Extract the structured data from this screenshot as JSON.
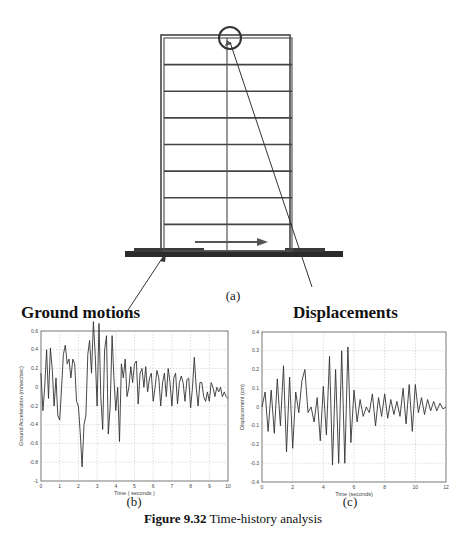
{
  "figure": {
    "caption_prefix": "Figure 9.32",
    "caption_text": " Time-history analysis",
    "panel_a_label": "(a)",
    "panel_b_label": "(b)",
    "panel_c_label": "(c)",
    "left_annotation": "Ground motions",
    "right_annotation": "Displacements"
  },
  "building": {
    "stories": 8,
    "description": "Multi-story frame with central column, top-right marked with circle, ground motion arrow at base"
  },
  "chart_data": [
    {
      "type": "line",
      "panel": "(b)",
      "title": "",
      "xlabel": "Time ( seconds )",
      "ylabel": "Ground Acceleration (m/sec/sec)",
      "xlim": [
        0,
        10
      ],
      "ylim": [
        -1,
        0.6
      ],
      "xticks": [
        "0",
        "1",
        "2",
        "3",
        "4",
        "5",
        "6",
        "7",
        "8",
        "9",
        "10"
      ],
      "yticks": [
        "0.6",
        "0.4",
        "0.2",
        "0",
        "-0.2",
        "-0.4",
        "-0.6",
        "-0.8",
        "-1"
      ],
      "grid": true,
      "x": [
        0,
        0.1,
        0.2,
        0.3,
        0.4,
        0.5,
        0.6,
        0.7,
        0.8,
        0.9,
        1.0,
        1.1,
        1.2,
        1.3,
        1.4,
        1.5,
        1.6,
        1.7,
        1.8,
        1.9,
        2.0,
        2.1,
        2.2,
        2.3,
        2.4,
        2.5,
        2.6,
        2.7,
        2.8,
        2.9,
        3.0,
        3.1,
        3.2,
        3.3,
        3.4,
        3.5,
        3.6,
        3.7,
        3.8,
        3.9,
        4.0,
        4.1,
        4.2,
        4.3,
        4.4,
        4.5,
        4.6,
        4.7,
        4.8,
        4.9,
        5.0,
        5.1,
        5.2,
        5.3,
        5.4,
        5.5,
        5.6,
        5.7,
        5.8,
        5.9,
        6.0,
        6.1,
        6.2,
        6.3,
        6.4,
        6.5,
        6.6,
        6.7,
        6.8,
        6.9,
        7.0,
        7.1,
        7.2,
        7.3,
        7.4,
        7.5,
        7.6,
        7.7,
        7.8,
        7.9,
        8.0,
        8.1,
        8.2,
        8.3,
        8.4,
        8.5,
        8.6,
        8.7,
        8.8,
        8.9,
        9.0,
        9.1,
        9.2,
        9.3,
        9.4,
        9.5,
        9.6,
        9.7,
        9.8,
        9.9,
        10.0
      ],
      "values": [
        0.15,
        -0.25,
        0.0,
        0.4,
        -0.12,
        0.42,
        0.2,
        -0.2,
        0.1,
        -0.3,
        -0.35,
        0.0,
        0.35,
        0.45,
        0.25,
        0.3,
        0.1,
        0.3,
        0.25,
        -0.15,
        -0.2,
        -0.5,
        -0.85,
        -0.4,
        -0.3,
        0.35,
        0.5,
        0.15,
        0.7,
        0.35,
        -0.2,
        0.68,
        -0.1,
        -0.45,
        0.4,
        0.55,
        -0.5,
        -0.2,
        0.55,
        0.1,
        -0.25,
        0.0,
        -0.58,
        0.25,
        0.1,
        0.3,
        -0.1,
        0.0,
        0.22,
        0.05,
        0.25,
        0.28,
        -0.18,
        0.15,
        0.2,
        0.0,
        0.22,
        -0.05,
        0.1,
        0.15,
        -0.15,
        0.0,
        0.18,
        0.1,
        -0.2,
        0.05,
        0.15,
        -0.1,
        0.2,
        0.05,
        -0.2,
        0.1,
        0.15,
        -0.18,
        0.05,
        0.12,
        0.05,
        -0.15,
        0.08,
        0.1,
        -0.22,
        0.0,
        0.32,
        0.0,
        -0.2,
        0.05,
        0.05,
        -0.1,
        -0.15,
        -0.05,
        -0.15,
        0.05,
        0.0,
        -0.1,
        0.0,
        -0.05,
        0.0,
        -0.1,
        -0.05,
        -0.1,
        -0.12
      ]
    },
    {
      "type": "line",
      "panel": "(c)",
      "title": "",
      "xlabel": "Time (seconds)",
      "ylabel": "Displacement (cm)",
      "xlim": [
        0,
        12
      ],
      "ylim": [
        -0.4,
        0.4
      ],
      "xticks": [
        "0",
        "2",
        "4",
        "6",
        "8",
        "10",
        "12"
      ],
      "yticks": [
        "0.4",
        "0.3",
        "0.2",
        "0.1",
        "0",
        "-0.1",
        "-0.2",
        "-0.3",
        "-0.4"
      ],
      "grid": true,
      "x": [
        0,
        0.2,
        0.4,
        0.6,
        0.8,
        1.0,
        1.2,
        1.4,
        1.6,
        1.8,
        2.0,
        2.2,
        2.4,
        2.6,
        2.8,
        3.0,
        3.2,
        3.4,
        3.6,
        3.8,
        4.0,
        4.2,
        4.4,
        4.6,
        4.8,
        5.0,
        5.2,
        5.4,
        5.6,
        5.8,
        6.0,
        6.2,
        6.4,
        6.6,
        6.8,
        7.0,
        7.2,
        7.4,
        7.6,
        7.8,
        8.0,
        8.2,
        8.4,
        8.6,
        8.8,
        9.0,
        9.2,
        9.4,
        9.6,
        9.8,
        10.0,
        10.2,
        10.4,
        10.6,
        10.8,
        11.0,
        11.2,
        11.4,
        11.6,
        11.8,
        12.0
      ],
      "values": [
        0.0,
        0.08,
        -0.13,
        0.09,
        -0.14,
        0.15,
        -0.1,
        0.22,
        -0.24,
        0.16,
        -0.22,
        0.08,
        -0.03,
        0.14,
        0.2,
        -0.03,
        0.0,
        -0.08,
        0.05,
        -0.18,
        0.11,
        -0.15,
        0.27,
        -0.31,
        0.2,
        -0.3,
        0.3,
        -0.3,
        0.32,
        -0.19,
        0.09,
        -0.08,
        0.04,
        -0.05,
        0.0,
        -0.03,
        0.07,
        -0.1,
        0.05,
        -0.05,
        0.07,
        -0.06,
        0.04,
        -0.04,
        0.03,
        -0.05,
        0.1,
        -0.09,
        0.12,
        -0.13,
        0.12,
        -0.03,
        0.05,
        -0.04,
        0.04,
        -0.02,
        0.03,
        -0.02,
        0.02,
        -0.01,
        0.0
      ]
    }
  ]
}
